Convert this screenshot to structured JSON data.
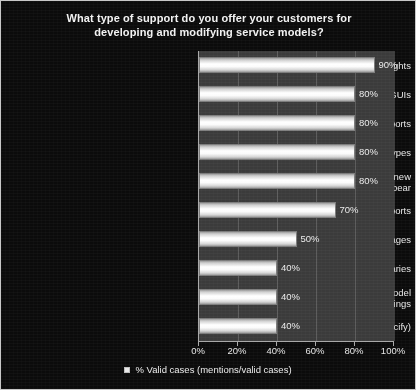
{
  "chart_data": {
    "type": "bar",
    "orientation": "horizontal",
    "title": "What type of support do you offer your customers for\ndeveloping and modifying service models?",
    "xlabel": "",
    "ylabel": "",
    "xlim": [
      0,
      100
    ],
    "xtick_labels": [
      "0%",
      "20%",
      "40%",
      "60%",
      "80%",
      "100%"
    ],
    "xtick_values": [
      0,
      20,
      40,
      60,
      80,
      100
    ],
    "grid": true,
    "legend_position": "bottom-center",
    "legend": [
      "% Valid cases (mentions/valid cases)"
    ],
    "categories": [
      "Unique access rights",
      "Unique GUIs",
      "Unique reports",
      "Discovery for CI classes and/or types",
      "Automated model population when new\nCIs appear",
      "Approved versus discovered CI reports",
      "Drag and drop model linkages",
      "Model libraries",
      "Policies to support consistent model\ngroupings",
      "Other (please specify)"
    ],
    "values": [
      90,
      80,
      80,
      80,
      80,
      70,
      50,
      40,
      40,
      40
    ],
    "value_labels": [
      "90%",
      "80%",
      "80%",
      "80%",
      "80%",
      "70%",
      "50%",
      "40%",
      "40%",
      "40%"
    ],
    "series": [
      {
        "name": "% Valid cases (mentions/valid cases)",
        "values": [
          90,
          80,
          80,
          80,
          80,
          70,
          50,
          40,
          40,
          40
        ]
      }
    ]
  },
  "colors": {
    "figure_background": "#0b0b0b",
    "plot_background": "#3b3b3b",
    "bar_fill": "#ffffff",
    "bar_edge": "#7d7d7d",
    "text": "#e6e6e6",
    "axis": "#a9a9a9",
    "frame_border": "#c8c8c8"
  },
  "legend": {
    "marker": "square-marker",
    "label": "% Valid cases (mentions/valid cases)"
  }
}
